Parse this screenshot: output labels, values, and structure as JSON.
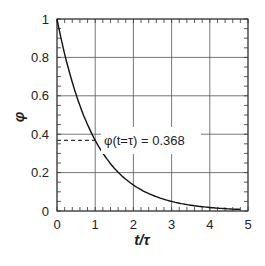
{
  "chart_data": {
    "type": "line",
    "title": "",
    "xlabel": "t/τ",
    "ylabel": "φ",
    "xlim": [
      0,
      5
    ],
    "ylim": [
      0,
      1
    ],
    "x_ticks": [
      "0",
      "1",
      "2",
      "3",
      "4",
      "5"
    ],
    "y_ticks": [
      "0",
      "0.2",
      "0.4",
      "0.6",
      "0.8",
      "1"
    ],
    "grid": true,
    "legend": null,
    "series": [
      {
        "name": "φ = exp(-t/τ)",
        "x": [
          0,
          0.25,
          0.5,
          0.75,
          1,
          1.5,
          2,
          2.5,
          3,
          3.5,
          4,
          4.5,
          4.8
        ],
        "values": [
          1,
          0.779,
          0.607,
          0.472,
          0.368,
          0.223,
          0.135,
          0.082,
          0.05,
          0.03,
          0.018,
          0.011,
          0.008
        ]
      }
    ],
    "annotations": [
      {
        "text": "φ(t=τ) = 0.368",
        "x": 1,
        "y": 0.368,
        "style": "dashed horizontal marker from y-axis to curve"
      }
    ]
  }
}
